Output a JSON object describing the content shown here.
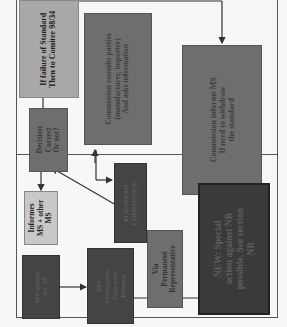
{
  "orientation": "rotated-90-ccw",
  "colors": {
    "frame": "#555555",
    "light_gray_box": "#a8a8a8",
    "pale_gray_box": "#c8c8c8",
    "mid_gray_box": "#6e6e6e",
    "dark_gray_box": "#4a4a4a",
    "darkest_box": "#3a3a3a",
    "text_light": "#222222",
    "text_on_dark": "#6a6a6a",
    "arrow": "#333333"
  },
  "nodes": {
    "ms_applies": {
      "label": "MS applies\nArt. 18"
    },
    "ms_notification": {
      "label": "MS\nNotification\nFalls with\nReasons"
    },
    "informs_ms": {
      "label": "Informes\nMS + other\nMS"
    },
    "decision": {
      "label": "Decision\nCorrect\nOr not?"
    },
    "european_commission": {
      "label": "EUROPEAN\nCOMMISSION"
    },
    "permanent_rep": {
      "label": "Via\nPermanent\nRepresentative"
    },
    "failure_standard": {
      "label": "If failure of Standard\nThen to Comitee 98/34"
    },
    "commission_consults": {
      "label": "Commission consults parties\n(manufacturer, importer)\nAnd asks information"
    },
    "commission_informs": {
      "label": "Commission informs MS\nIf need to withdraw\nthe standard"
    },
    "new_special_action": {
      "label": "NEW: Special\naction against NB\npossible. See section\nNB"
    }
  }
}
